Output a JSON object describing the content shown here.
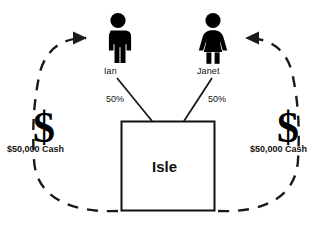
{
  "diagram": {
    "background_color": "#ffffff",
    "line_color": "#1a1a1a",
    "entity": {
      "name": "Isle",
      "shape": "rectangle",
      "border_color": "#111111"
    },
    "owners": [
      {
        "id": "ian",
        "name": "Ian",
        "icon": "male-figure-icon",
        "ownership_label": "50%",
        "contribution_label": "$50,000 Cash",
        "currency_symbol": "$",
        "side": "left"
      },
      {
        "id": "janet",
        "name": "Janet",
        "icon": "female-figure-icon",
        "ownership_label": "50%",
        "contribution_label": "$50,000 Cash",
        "currency_symbol": "$",
        "side": "right"
      }
    ],
    "flows": [
      {
        "id": "left-cash-flow",
        "style": "dashed",
        "from": "isle",
        "to": "ian",
        "arrow": "right"
      },
      {
        "id": "right-cash-flow",
        "style": "dashed",
        "from": "isle",
        "to": "janet",
        "arrow": "left"
      }
    ]
  }
}
